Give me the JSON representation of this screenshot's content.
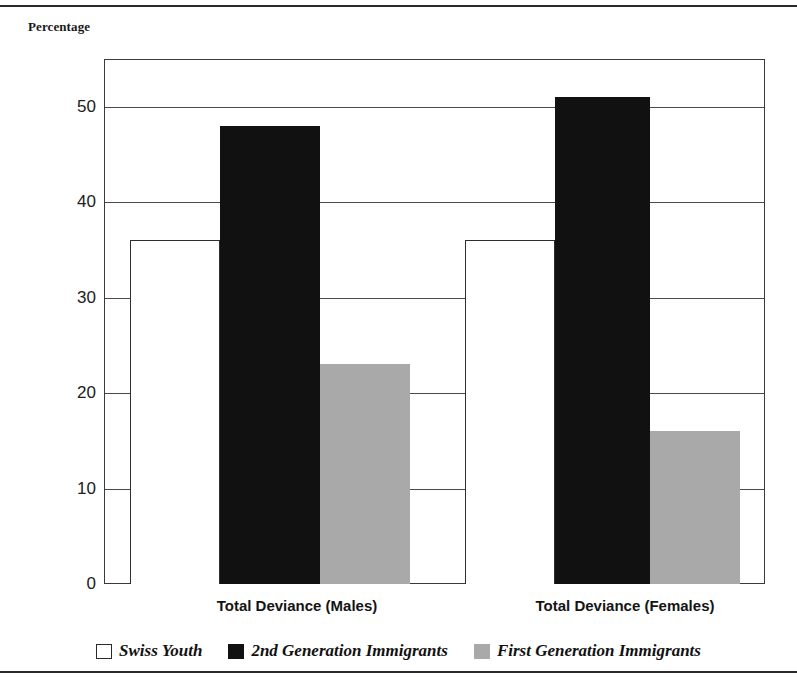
{
  "axis_title": "Percentage",
  "chart_data": {
    "type": "bar",
    "title": "",
    "subtitle": "",
    "xlabel": "",
    "ylabel": "Percentage",
    "ylim": [
      0,
      55
    ],
    "ytick_labels": [
      "0",
      "10",
      "20",
      "30",
      "40",
      "50"
    ],
    "ytick_values": [
      0,
      10,
      20,
      30,
      40,
      50
    ],
    "grid": true,
    "grid_orientation": "horizontal",
    "legend_position": "bottom-center",
    "categories": [
      "Total Deviance (Males)",
      "Total Deviance (Females)"
    ],
    "series": [
      {
        "name": "Swiss Youth",
        "color": "#ffffff",
        "values": [
          36,
          36
        ]
      },
      {
        "name": "2nd Generation Immigrants",
        "color": "#111111",
        "values": [
          48,
          51
        ]
      },
      {
        "name": "First Generation Immigrants",
        "color": "#a9a9a9",
        "values": [
          23,
          16
        ]
      }
    ]
  },
  "legend": [
    {
      "label": "Swiss Youth",
      "swatch": "white"
    },
    {
      "label": "2nd Generation Immigrants",
      "swatch": "black"
    },
    {
      "label": "First Generation Immigrants",
      "swatch": "gray"
    }
  ],
  "ticks": [
    {
      "value": 50,
      "label": "50"
    },
    {
      "value": 40,
      "label": "40"
    },
    {
      "value": 30,
      "label": "30"
    },
    {
      "value": 20,
      "label": "20"
    },
    {
      "value": 10,
      "label": "10"
    },
    {
      "value": 0,
      "label": "0"
    }
  ],
  "bars": [
    {
      "group": 0,
      "series": "Swiss Youth",
      "value": 36,
      "style": "white",
      "x": 26,
      "w": 90
    },
    {
      "group": 0,
      "series": "2nd Generation Immigrants",
      "value": 48,
      "style": "black",
      "x": 116,
      "w": 100
    },
    {
      "group": 0,
      "series": "First Generation Immigrants",
      "value": 23,
      "style": "gray",
      "x": 216,
      "w": 90
    },
    {
      "group": 1,
      "series": "Swiss Youth",
      "value": 36,
      "style": "white",
      "x": 361,
      "w": 90
    },
    {
      "group": 1,
      "series": "2nd Generation Immigrants",
      "value": 51,
      "style": "black",
      "x": 451,
      "w": 95
    },
    {
      "group": 1,
      "series": "First Generation Immigrants",
      "value": 16,
      "style": "gray",
      "x": 546,
      "w": 90
    }
  ],
  "xlabels": [
    {
      "text": "Total Deviance (Males)",
      "left": 147,
      "width": 300
    },
    {
      "text": "Total Deviance (Females)",
      "left": 475,
      "width": 300
    }
  ]
}
